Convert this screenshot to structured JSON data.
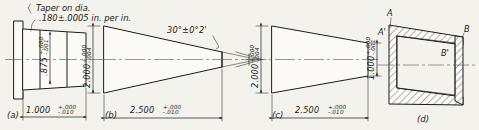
{
  "drawing": {
    "title": "Taper dimensioning methods",
    "background_color": "#f4f2ec",
    "line_color": "#1c1c1c"
  },
  "note": {
    "line1": "Taper on dia.",
    "line2": ".180±.0005 in. per in."
  },
  "panels": [
    {
      "id": "a",
      "label": "(a)",
      "dimensions": [
        {
          "name": "diameter",
          "orientation": "vertical",
          "value": ".875",
          "tol_upper": "+.000",
          "tol_lower": "-.001"
        },
        {
          "name": "length",
          "orientation": "horizontal",
          "value": "1.000",
          "tol_upper": "+.000",
          "tol_lower": "-.010"
        }
      ]
    },
    {
      "id": "b",
      "label": "(b)",
      "dimensions": [
        {
          "name": "large-diameter",
          "orientation": "vertical",
          "value": "2.000",
          "tol_upper": "+.000",
          "tol_lower": "-.004"
        },
        {
          "name": "length",
          "orientation": "horizontal",
          "value": "2.500",
          "tol_upper": "+.000",
          "tol_lower": "-.010"
        }
      ],
      "angle": "30°±0°2'"
    },
    {
      "id": "c",
      "label": "(c)",
      "dimensions": [
        {
          "name": "large-diameter",
          "orientation": "vertical",
          "value": "2.000",
          "tol_upper": "+.000",
          "tol_lower": "-.004"
        },
        {
          "name": "small-diameter",
          "orientation": "vertical",
          "value": "1.000",
          "tol_upper": "+.000",
          "tol_lower": "-.001"
        },
        {
          "name": "length",
          "orientation": "horizontal",
          "value": "2.500",
          "tol_upper": "+.000",
          "tol_lower": "-.010"
        }
      ]
    },
    {
      "id": "d",
      "label": "(d)",
      "point_labels": {
        "top_outer": "A",
        "top_inner": "A'",
        "right_outer": "B",
        "right_inner": "B'"
      }
    }
  ]
}
